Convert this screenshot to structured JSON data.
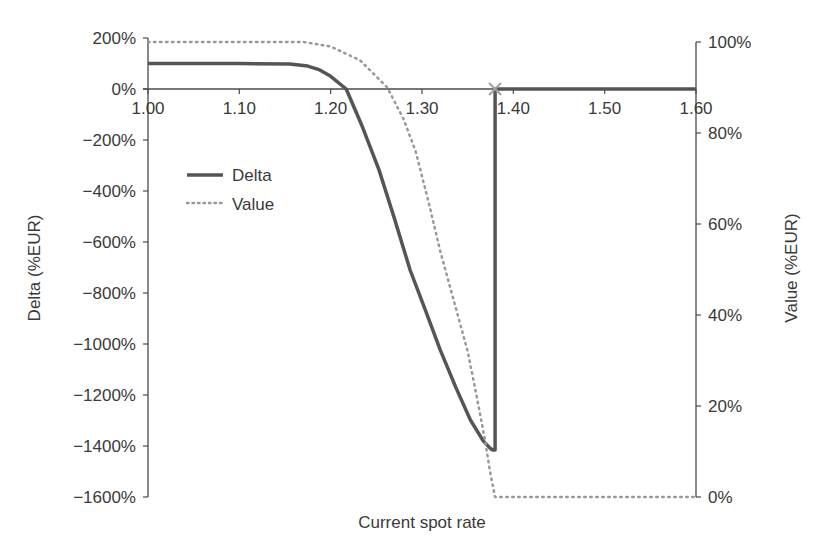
{
  "chart_data": {
    "type": "line",
    "title": "",
    "xlabel": "Current spot rate",
    "ylabel": "Delta (%EUR)",
    "y2label": "Value (%EUR)",
    "xlim": [
      1.0,
      1.6
    ],
    "ylim": [
      -1600,
      200
    ],
    "y2lim": [
      0,
      100
    ],
    "x_ticks": [
      "1.00",
      "1.10",
      "1.20",
      "1.30",
      "1.40",
      "1.50",
      "1.60"
    ],
    "y_ticks": [
      "200%",
      "0%",
      "−200%",
      "−400%",
      "−600%",
      "−800%",
      "−1000%",
      "−1200%",
      "−1400%",
      "−1600%"
    ],
    "y2_ticks": [
      "100%",
      "80%",
      "60%",
      "40%",
      "20%",
      "0%"
    ],
    "grid": false,
    "legend_position": "upper-left inside",
    "annotations": [
      {
        "type": "x-marker",
        "x": 1.38,
        "y": 0,
        "color": "#a0a0a0"
      }
    ],
    "series": [
      {
        "name": "Delta",
        "axis": "left",
        "style": "solid",
        "color": "#555555",
        "x": [
          1.0,
          1.1,
          1.155,
          1.175,
          1.188,
          1.2,
          1.217,
          1.235,
          1.253,
          1.27,
          1.287,
          1.305,
          1.32,
          1.337,
          1.353,
          1.367,
          1.375,
          1.378,
          1.38,
          1.38,
          1.6
        ],
        "y": [
          100,
          100,
          98,
          90,
          75,
          50,
          0,
          -150,
          -318,
          -510,
          -710,
          -880,
          -1024,
          -1170,
          -1298,
          -1380,
          -1410,
          -1416,
          -1416,
          0,
          0
        ]
      },
      {
        "name": "Value",
        "axis": "right",
        "style": "dotted",
        "color": "#999999",
        "x": [
          1.0,
          1.1,
          1.17,
          1.2,
          1.232,
          1.262,
          1.28,
          1.293,
          1.307,
          1.32,
          1.335,
          1.35,
          1.36,
          1.369,
          1.375,
          1.38,
          1.6
        ],
        "y": [
          100,
          100,
          100,
          99,
          96,
          90,
          83,
          76,
          65,
          54,
          43,
          32,
          22,
          12.5,
          5,
          0,
          0
        ]
      }
    ]
  }
}
